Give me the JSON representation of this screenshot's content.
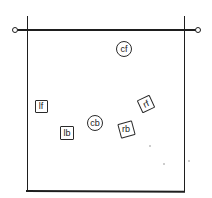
{
  "diagram": {
    "frame": {
      "left_x": 27,
      "right_x": 184,
      "top_y": 16,
      "bottom_y": 190,
      "rail_y": 30,
      "rail_left_end_x": 15,
      "rail_right_end_x": 198,
      "stroke_color": "#1e1e1e"
    },
    "nodes": [
      {
        "id": "cf",
        "label": "cf",
        "shape": "circle",
        "cx": 124,
        "cy": 49,
        "size": 16,
        "rotation": 0
      },
      {
        "id": "lf",
        "label": "lf",
        "shape": "square",
        "cx": 41,
        "cy": 106,
        "size": 13,
        "rotation": 0
      },
      {
        "id": "lb",
        "label": "lb",
        "shape": "square",
        "cx": 67,
        "cy": 133,
        "size": 14,
        "rotation": 0
      },
      {
        "id": "cb",
        "label": "cb",
        "shape": "circle",
        "cx": 95,
        "cy": 123,
        "size": 16,
        "rotation": 0
      },
      {
        "id": "rb",
        "label": "rb",
        "shape": "square",
        "cx": 126,
        "cy": 129,
        "size": 15,
        "rotation": -15
      },
      {
        "id": "rf",
        "label": "rf",
        "shape": "square",
        "cx": 146,
        "cy": 104,
        "size": 14,
        "rotation": -25
      }
    ]
  }
}
